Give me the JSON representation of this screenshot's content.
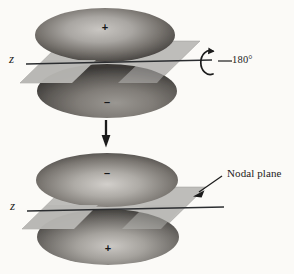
{
  "figure": {
    "background_color": "#fbfaf7",
    "ink_color": "#1b1b1b",
    "plane_color": "#b3b3b3"
  },
  "diagram_top": {
    "axis_label": "z",
    "upper_lobe_sign": "+",
    "lower_lobe_sign": "–",
    "rotation_label": "180°",
    "rotation_icon": "rotation-arrow-icon"
  },
  "transition": {
    "arrow_icon": "down-arrow-icon"
  },
  "diagram_bottom": {
    "axis_label": "z",
    "upper_lobe_sign": "–",
    "lower_lobe_sign": "+",
    "annotation_label": "Nodal plane",
    "annotation_icon": "pointer-arrow-icon"
  }
}
